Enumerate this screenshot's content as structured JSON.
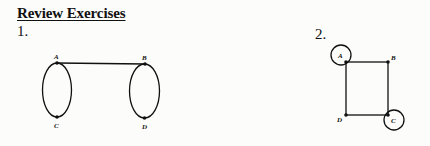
{
  "heading": "Review Exercises",
  "exercises": [
    {
      "number": "1.",
      "graph": {
        "vertices": [
          "A",
          "B",
          "C",
          "D"
        ],
        "edges": [
          [
            "A",
            "B"
          ],
          [
            "A",
            "C"
          ],
          [
            "A",
            "C"
          ],
          [
            "B",
            "D"
          ],
          [
            "B",
            "D"
          ]
        ]
      }
    },
    {
      "number": "2.",
      "graph": {
        "vertices": [
          "A",
          "B",
          "C",
          "D"
        ],
        "edges": [
          [
            "A",
            "B"
          ],
          [
            "B",
            "C"
          ],
          [
            "C",
            "D"
          ],
          [
            "D",
            "A"
          ],
          [
            "A",
            "A"
          ],
          [
            "C",
            "C"
          ]
        ]
      }
    }
  ],
  "labels": {
    "g1": {
      "A": "A",
      "B": "B",
      "C": "C",
      "D": "D"
    },
    "g2": {
      "A": "A",
      "B": "B",
      "C": "C",
      "D": "D"
    }
  }
}
